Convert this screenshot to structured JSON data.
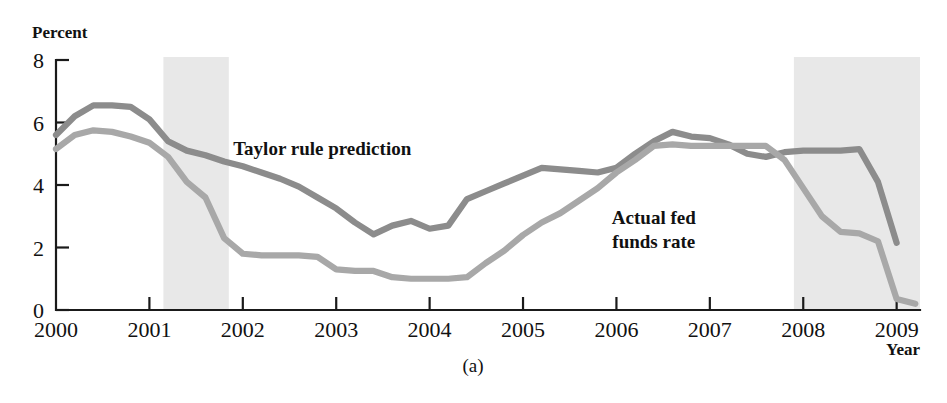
{
  "figure": {
    "caption": "(a)",
    "ylabel": "Percent",
    "xlabel": "Year"
  },
  "chart_data": {
    "type": "line",
    "title": "",
    "xlabel": "Year",
    "ylabel": "Percent",
    "xlim": [
      2000,
      2009.25
    ],
    "ylim": [
      0,
      8
    ],
    "xticks": [
      2000,
      2001,
      2002,
      2003,
      2004,
      2005,
      2006,
      2007,
      2008,
      2009
    ],
    "xtick_labels": [
      "2000",
      "2001",
      "2002",
      "2003",
      "2004",
      "2005",
      "2006",
      "2007",
      "2008",
      "2009"
    ],
    "yticks": [
      0,
      2,
      4,
      6,
      8
    ],
    "ytick_labels": [
      "0",
      "2",
      "4",
      "6",
      "8"
    ],
    "grid": false,
    "legend_position": "inline-annotation",
    "colors": {
      "taylor_rule": "#8c8c8c",
      "actual_fed_funds": "#a8a8a8",
      "recession_band": "#e8e8e8",
      "axis": "#1a1a1a",
      "text": "#111111"
    },
    "annotations": [
      {
        "text": "Taylor rule prediction",
        "x": 2002.85,
        "y": 4.95,
        "series": "Taylor rule prediction"
      },
      {
        "text": "Actual fed funds rate",
        "x": 2006.4,
        "y": 2.75,
        "series": "Actual fed funds rate",
        "lines": [
          "Actual fed",
          "funds rate"
        ]
      }
    ],
    "shaded_regions": [
      {
        "label": "recession",
        "x_start": 2001.15,
        "x_end": 2001.85
      },
      {
        "label": "recession",
        "x_start": 2007.9,
        "x_end": 2009.25
      }
    ],
    "series": [
      {
        "name": "Taylor rule prediction",
        "color": "#8c8c8c",
        "x": [
          2000.0,
          2000.2,
          2000.4,
          2000.6,
          2000.8,
          2001.0,
          2001.2,
          2001.4,
          2001.6,
          2001.8,
          2002.0,
          2002.2,
          2002.4,
          2002.6,
          2002.8,
          2003.0,
          2003.2,
          2003.4,
          2003.6,
          2003.8,
          2004.0,
          2004.2,
          2004.4,
          2004.6,
          2004.8,
          2005.0,
          2005.2,
          2005.4,
          2005.6,
          2005.8,
          2006.0,
          2006.2,
          2006.4,
          2006.6,
          2006.8,
          2007.0,
          2007.2,
          2007.4,
          2007.6,
          2007.8,
          2008.0,
          2008.2,
          2008.4,
          2008.6,
          2008.8,
          2009.0
        ],
        "values": [
          5.6,
          6.2,
          6.55,
          6.55,
          6.5,
          6.1,
          5.4,
          5.1,
          4.95,
          4.75,
          4.6,
          4.4,
          4.2,
          3.95,
          3.6,
          3.25,
          2.8,
          2.42,
          2.7,
          2.85,
          2.6,
          2.7,
          3.55,
          3.8,
          4.05,
          4.3,
          4.55,
          4.5,
          4.45,
          4.4,
          4.55,
          5.0,
          5.4,
          5.7,
          5.55,
          5.5,
          5.3,
          5.0,
          4.9,
          5.05,
          5.1,
          5.1,
          5.1,
          5.15,
          4.1,
          2.15
        ]
      },
      {
        "name": "Actual fed funds rate",
        "color": "#a8a8a8",
        "x": [
          2000.0,
          2000.2,
          2000.4,
          2000.6,
          2000.8,
          2001.0,
          2001.2,
          2001.4,
          2001.6,
          2001.8,
          2002.0,
          2002.2,
          2002.4,
          2002.6,
          2002.8,
          2003.0,
          2003.2,
          2003.4,
          2003.6,
          2003.8,
          2004.0,
          2004.2,
          2004.4,
          2004.6,
          2004.8,
          2005.0,
          2005.2,
          2005.4,
          2005.6,
          2005.8,
          2006.0,
          2006.2,
          2006.4,
          2006.6,
          2006.8,
          2007.0,
          2007.2,
          2007.4,
          2007.6,
          2007.8,
          2008.0,
          2008.2,
          2008.4,
          2008.6,
          2008.8,
          2009.0,
          2009.2
        ],
        "values": [
          5.15,
          5.6,
          5.75,
          5.7,
          5.55,
          5.35,
          4.9,
          4.1,
          3.6,
          2.3,
          1.8,
          1.75,
          1.75,
          1.75,
          1.7,
          1.3,
          1.25,
          1.25,
          1.05,
          1.0,
          1.0,
          1.0,
          1.05,
          1.5,
          1.9,
          2.4,
          2.8,
          3.1,
          3.5,
          3.9,
          4.4,
          4.8,
          5.25,
          5.3,
          5.25,
          5.25,
          5.25,
          5.25,
          5.25,
          4.8,
          3.9,
          3.0,
          2.5,
          2.45,
          2.2,
          0.35,
          0.2
        ]
      }
    ]
  },
  "axes_geometry": {
    "plot_left_px": 56,
    "plot_right_px": 920,
    "plot_top_px": 60,
    "plot_bottom_px": 310,
    "x_per_year_px": 93.5,
    "y_per_unit_px": 30.3
  }
}
